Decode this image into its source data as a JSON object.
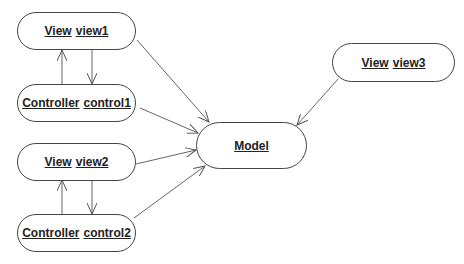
{
  "diagram": {
    "type": "MVC object diagram",
    "nodes": [
      {
        "id": "view1",
        "class": "View",
        "name": "view1"
      },
      {
        "id": "control1",
        "class": "Controller",
        "name": "control1"
      },
      {
        "id": "view2",
        "class": "View",
        "name": "view2"
      },
      {
        "id": "control2",
        "class": "Controller",
        "name": "control2"
      },
      {
        "id": "model",
        "class": "",
        "name": "Model"
      },
      {
        "id": "view3",
        "class": "View",
        "name": "view3"
      }
    ],
    "edges": [
      {
        "from": "control1",
        "to": "view1"
      },
      {
        "from": "view1",
        "to": "control1"
      },
      {
        "from": "control2",
        "to": "view2"
      },
      {
        "from": "view2",
        "to": "control2"
      },
      {
        "from": "view1",
        "to": "model"
      },
      {
        "from": "control1",
        "to": "model"
      },
      {
        "from": "view2",
        "to": "model"
      },
      {
        "from": "control2",
        "to": "model"
      },
      {
        "from": "view3",
        "to": "model"
      }
    ],
    "colors": {
      "line": "#555555",
      "border": "#444444",
      "text": "#222222"
    }
  }
}
